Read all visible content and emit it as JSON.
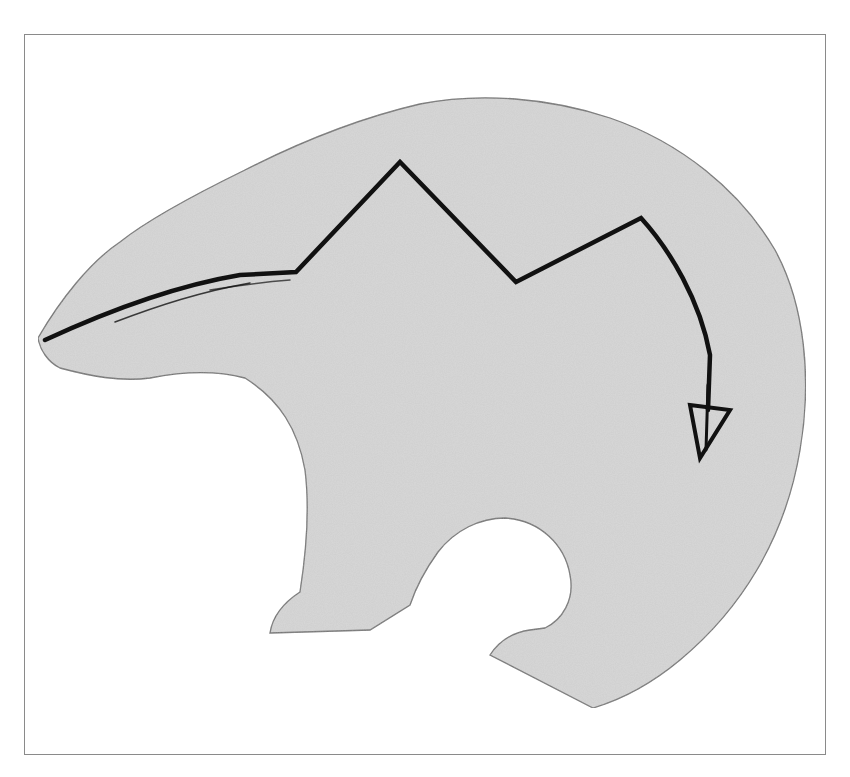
{
  "figure": {
    "colors": {
      "background": "#ffffff",
      "frame_border": "#8a8a8a",
      "paper_fill": "#d9d9d9",
      "paper_edge": "#6e6e6e",
      "heartline_ink": "#111111"
    },
    "icons": [
      "bear-silhouette-icon",
      "heartline-arrow-icon"
    ]
  },
  "caption": {
    "text": ""
  }
}
